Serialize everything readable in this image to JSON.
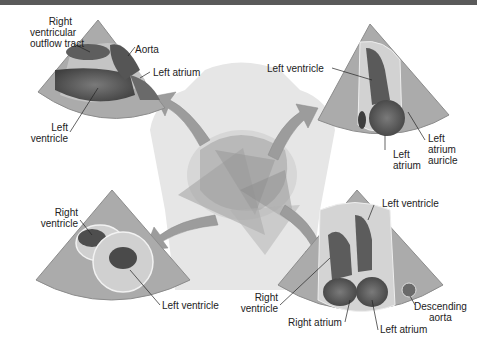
{
  "header": {
    "title_strip": ""
  },
  "figure": {
    "center": {
      "name": "torso-with-heart-and-scan-planes"
    },
    "panels": [
      {
        "id": "top-left",
        "view": "parasternal long axis",
        "labels": [
          "Right ventricular outflow tract",
          "Aorta",
          "Left atrium",
          "Left ventricle"
        ]
      },
      {
        "id": "top-right",
        "view": "apical two-chamber",
        "labels": [
          "Left ventricle",
          "Left atrium",
          "Left atrium auricle"
        ]
      },
      {
        "id": "bottom-left",
        "view": "parasternal short axis",
        "labels": [
          "Right ventricle",
          "Left ventricle"
        ]
      },
      {
        "id": "bottom-right",
        "view": "apical four-chamber",
        "labels": [
          "Left ventricle",
          "Right ventricle",
          "Right atrium",
          "Left atrium",
          "Descending aorta"
        ]
      }
    ]
  },
  "labels": {
    "tl_rvot": "Right\nventricular\noutflow tract",
    "tl_rvot_l1": "Right",
    "tl_rvot_l2": "ventricular",
    "tl_rvot_l3": "outflow tract",
    "tl_aorta": "Aorta",
    "tl_la": "Left atrium",
    "tl_lv_l1": "Left",
    "tl_lv_l2": "ventricle",
    "tr_lv": "Left ventricle",
    "tr_la_l1": "Left",
    "tr_la_l2": "atrium",
    "tr_laa_l1": "Left",
    "tr_laa_l2": "atrium",
    "tr_laa_l3": "auricle",
    "bl_rv_l1": "Right",
    "bl_rv_l2": "ventricle",
    "bl_lv": "Left ventricle",
    "br_lv": "Left ventricle",
    "br_rv_l1": "Right",
    "br_rv_l2": "ventricle",
    "br_ra": "Right atrium",
    "br_la": "Left atrium",
    "br_da_l1": "Descending",
    "br_da_l2": "aorta"
  },
  "colors": {
    "fan": "#a9a9a9",
    "fan_edge": "#8c8c8c",
    "tissue": "#c6c6c6",
    "chamber": "#5a5a5a",
    "torso": "#e4e4e4",
    "arrow": "#9a9a9a",
    "topbar": "#5a5a5a"
  }
}
